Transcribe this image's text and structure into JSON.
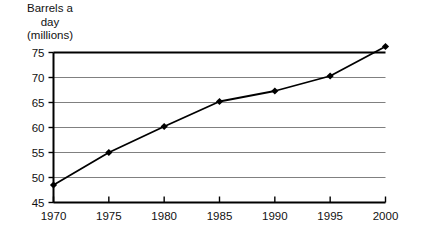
{
  "chart_data": {
    "type": "line",
    "title": "Barrels a day (millions)",
    "title_lines": [
      "Barrels a",
      "day",
      "(millions)"
    ],
    "xlabel": "",
    "ylabel": "Barrels a day (millions)",
    "x": [
      1970,
      1975,
      1980,
      1985,
      1990,
      1995,
      2000
    ],
    "values": [
      48.5,
      55.0,
      60.2,
      65.2,
      67.3,
      70.3,
      76.2
    ],
    "series": [
      {
        "name": "Barrels a day (millions)",
        "values": [
          48.5,
          55.0,
          60.2,
          65.2,
          67.3,
          70.3,
          76.2
        ]
      }
    ],
    "xtick_labels": [
      "1970",
      "1975",
      "1980",
      "1985",
      "1990",
      "1995",
      "2000"
    ],
    "ytick_labels": [
      "45",
      "50",
      "55",
      "60",
      "65",
      "70",
      "75"
    ],
    "yticks": [
      45,
      50,
      55,
      60,
      65,
      70,
      75
    ],
    "xlim": [
      1970,
      2000
    ],
    "ylim": [
      45,
      75
    ],
    "grid": true,
    "grid_axis": "y",
    "legend": false,
    "legend_position": "none",
    "marker": "diamond",
    "line_color": "#000000",
    "marker_color": "#000000",
    "grid_color": "#808080",
    "axis_color": "#000000",
    "background_color": "#ffffff"
  }
}
